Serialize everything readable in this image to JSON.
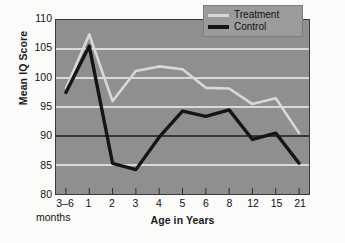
{
  "chart_data": {
    "type": "line",
    "title": "",
    "xlabel": "Age in Years",
    "ylabel": "Mean IQ Score",
    "x_unit_note": "months",
    "categories": [
      "3–6",
      "1",
      "2",
      "3",
      "4",
      "5",
      "6",
      "8",
      "12",
      "15",
      "21"
    ],
    "ylim": [
      80,
      110
    ],
    "yticks": [
      80,
      85,
      90,
      95,
      100,
      105,
      110
    ],
    "xticks": [
      "3–6",
      "1",
      "2",
      "3",
      "4",
      "5",
      "6",
      "8",
      "12",
      "15",
      "21"
    ],
    "grid": true,
    "gridlines_y": [
      85,
      90,
      95,
      100,
      105
    ],
    "emphasized_gridline": 90,
    "legend_position": "top-right",
    "series": [
      {
        "name": "Treatment",
        "color": "#d9d9d9",
        "values": [
          98.2,
          107.5,
          96.0,
          101.2,
          102.0,
          101.5,
          98.3,
          98.2,
          95.5,
          96.5,
          90.5
        ]
      },
      {
        "name": "Control",
        "color": "#151515",
        "values": [
          97.5,
          105.5,
          85.3,
          84.2,
          89.8,
          94.3,
          93.4,
          94.5,
          89.4,
          90.5,
          85.3
        ]
      }
    ]
  },
  "legend": {
    "items": [
      {
        "label": "Treatment",
        "swatch": "treatment-line-swatch"
      },
      {
        "label": "Control",
        "swatch": "control-line-swatch"
      }
    ]
  },
  "axes": {
    "y_title": "Mean IQ Score",
    "x_title": "Age in Years",
    "x_unit": "months",
    "y_tick_labels": [
      "110",
      "105",
      "100",
      "95",
      "90",
      "85",
      "80"
    ],
    "x_tick_labels": [
      "3–6",
      "1",
      "2",
      "3",
      "4",
      "5",
      "6",
      "8",
      "12",
      "15",
      "21"
    ]
  },
  "colors": {
    "plot_background": "#8f8f8f",
    "page_background": "#fbfbfa",
    "gridline": "#f2f2f2",
    "gridline_emphasis": "#1b1b1b",
    "axis_border": "#3a3a3a",
    "treatment": "#d9d9d9",
    "control": "#151515",
    "legend_background": "#9b9b9b"
  }
}
